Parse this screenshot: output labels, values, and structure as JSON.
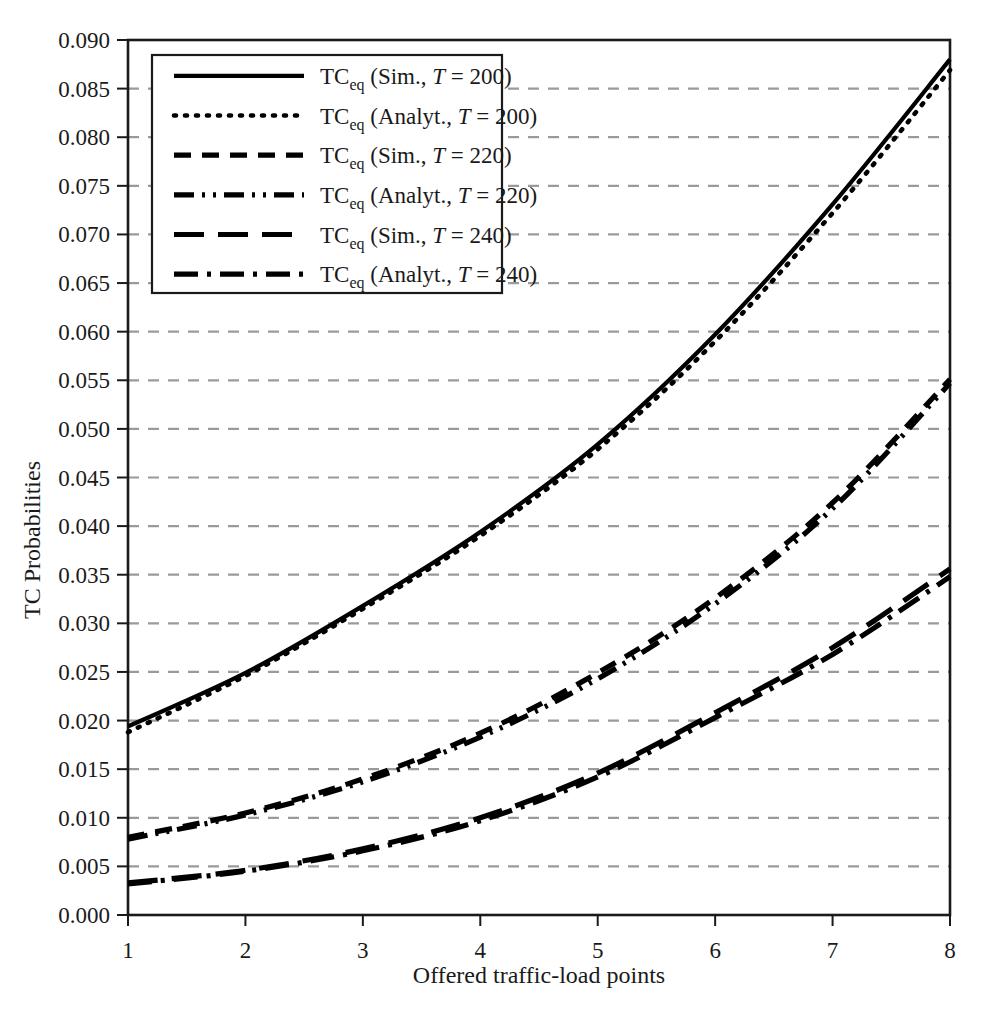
{
  "chart_data": {
    "type": "line",
    "title": "",
    "xlabel": "Offered traffic-load points",
    "ylabel": "TC Probabilities",
    "x": [
      1,
      2,
      3,
      4,
      5,
      6,
      7,
      8
    ],
    "xlim": [
      1,
      8
    ],
    "ylim": [
      0.0,
      0.09
    ],
    "grid": true,
    "grid_axis": "y",
    "grid_style": "dashed",
    "legend_position": "upper-left",
    "xticks": [
      "1",
      "2",
      "3",
      "4",
      "5",
      "6",
      "7",
      "8"
    ],
    "yticks": [
      "0.000",
      "0.005",
      "0.010",
      "0.015",
      "0.020",
      "0.025",
      "0.030",
      "0.035",
      "0.040",
      "0.045",
      "0.050",
      "0.055",
      "0.060",
      "0.065",
      "0.070",
      "0.075",
      "0.080",
      "0.085",
      "0.090"
    ],
    "series": [
      {
        "name": "TC_eq (Sim., T = 200)",
        "label_main": "TC",
        "label_sub": "eq",
        "label_rest_pre": " (Sim., ",
        "label_italic": "T",
        "label_rest_post": " = 200)",
        "style": "solid",
        "color": "#000000",
        "values": [
          0.0194,
          0.0249,
          0.0318,
          0.0394,
          0.0484,
          0.0597,
          0.0731,
          0.088
        ]
      },
      {
        "name": "TC_eq (Analyt., T = 200)",
        "label_main": "TC",
        "label_sub": "eq",
        "label_rest_pre": " (Analyt., ",
        "label_italic": "T",
        "label_rest_post": " = 200)",
        "style": "dotted",
        "color": "#000000",
        "values": [
          0.0188,
          0.0246,
          0.0315,
          0.039,
          0.0479,
          0.059,
          0.0722,
          0.0869
        ]
      },
      {
        "name": "TC_eq (Sim., T = 220)",
        "label_main": "TC",
        "label_sub": "eq",
        "label_rest_pre": " (Sim., ",
        "label_italic": "T",
        "label_rest_post": " = 220)",
        "style": "dashed",
        "color": "#000000",
        "values": [
          0.008,
          0.0105,
          0.014,
          0.0187,
          0.0249,
          0.0326,
          0.0424,
          0.0551
        ]
      },
      {
        "name": "TC_eq (Analyt., T = 220)",
        "label_main": "TC",
        "label_sub": "eq",
        "label_rest_pre": " (Analyt., ",
        "label_italic": "T",
        "label_rest_post": " = 220)",
        "style": "dash-dot-dot",
        "color": "#000000",
        "values": [
          0.0078,
          0.0103,
          0.0137,
          0.0183,
          0.0243,
          0.032,
          0.0418,
          0.0547
        ]
      },
      {
        "name": "TC_eq (Sim., T = 240)",
        "label_main": "TC",
        "label_sub": "eq",
        "label_rest_pre": " (Sim., ",
        "label_italic": "T",
        "label_rest_post": " = 240)",
        "style": "long-dash",
        "color": "#000000",
        "values": [
          0.0033,
          0.0046,
          0.0068,
          0.01,
          0.0146,
          0.0208,
          0.0275,
          0.0356
        ]
      },
      {
        "name": "TC_eq (Analyt., T = 240)",
        "label_main": "TC",
        "label_sub": "eq",
        "label_rest_pre": " (Analyt., ",
        "label_italic": "T",
        "label_rest_post": " = 240)",
        "style": "dash-dot",
        "color": "#000000",
        "values": [
          0.0032,
          0.0045,
          0.0066,
          0.0097,
          0.0142,
          0.0203,
          0.0268,
          0.0348
        ]
      }
    ]
  },
  "colors": {
    "line": "#000000",
    "grid": "#9a9a9a",
    "axis": "#1a1a1a",
    "background": "#ffffff"
  },
  "geometry": {
    "plot_left": 128,
    "plot_right": 950,
    "plot_top": 40,
    "plot_bottom": 915,
    "legend_left": 152,
    "legend_top": 55,
    "legend_right": 502,
    "legend_bottom": 293
  }
}
